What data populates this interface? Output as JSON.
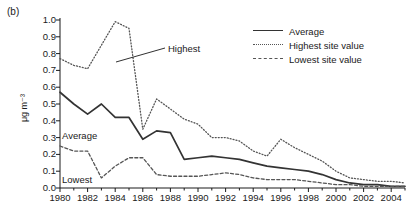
{
  "panel": {
    "label": "(b)"
  },
  "legend": {
    "items": [
      {
        "key": "solid",
        "label": "Average"
      },
      {
        "key": "dotted",
        "label": "Highest site value"
      },
      {
        "key": "dashed",
        "label": "Lowest site value"
      }
    ]
  },
  "annotations": [
    {
      "name": "highest",
      "label": "Highest"
    },
    {
      "name": "average",
      "label": "Average"
    },
    {
      "name": "lowest",
      "label": "Lowest"
    }
  ],
  "axis": {
    "y_label": "μg m⁻³",
    "y_ticks": [
      "1.0",
      "0.9",
      "0.8",
      "0.7",
      "0.6",
      "0.5",
      "0.4",
      "0.3",
      "0.2",
      "0.1",
      "0.0"
    ],
    "x_ticks": [
      "1980",
      "1982",
      "1984",
      "1986",
      "1988",
      "1990",
      "1992",
      "1994",
      "1996",
      "1998",
      "2000",
      "2002",
      "2004"
    ]
  },
  "chart_data": {
    "type": "line",
    "title": "",
    "xlabel": "",
    "ylabel": "μg m⁻³",
    "xlim": [
      1980,
      2005
    ],
    "ylim": [
      0.0,
      1.0
    ],
    "grid": false,
    "legend_position": "top-right",
    "x": [
      1980,
      1981,
      1982,
      1983,
      1984,
      1985,
      1986,
      1987,
      1988,
      1989,
      1990,
      1991,
      1992,
      1993,
      1994,
      1995,
      1996,
      1997,
      1998,
      1999,
      2000,
      2001,
      2002,
      2003,
      2004,
      2005
    ],
    "series": [
      {
        "name": "Average",
        "style": "solid",
        "color": "#333333",
        "values": [
          0.57,
          0.5,
          0.44,
          0.5,
          0.42,
          0.42,
          0.29,
          0.34,
          0.33,
          0.17,
          0.18,
          0.19,
          0.18,
          0.17,
          0.15,
          0.13,
          0.12,
          0.11,
          0.1,
          0.08,
          0.05,
          0.03,
          0.02,
          0.02,
          0.01,
          0.01
        ]
      },
      {
        "name": "Highest site value",
        "style": "dotted",
        "color": "#555555",
        "values": [
          0.77,
          0.73,
          0.71,
          0.85,
          0.99,
          0.95,
          0.35,
          0.53,
          0.47,
          0.41,
          0.38,
          0.3,
          0.3,
          0.28,
          0.22,
          0.19,
          0.29,
          0.24,
          0.2,
          0.16,
          0.1,
          0.06,
          0.05,
          0.04,
          0.04,
          0.03
        ]
      },
      {
        "name": "Lowest site value",
        "style": "dashed",
        "color": "#555555",
        "values": [
          0.25,
          0.22,
          0.22,
          0.06,
          0.13,
          0.18,
          0.18,
          0.08,
          0.07,
          0.07,
          0.07,
          0.08,
          0.09,
          0.08,
          0.06,
          0.05,
          0.05,
          0.05,
          0.04,
          0.03,
          0.02,
          0.02,
          0.01,
          0.01,
          0.01,
          0.01
        ]
      }
    ]
  }
}
